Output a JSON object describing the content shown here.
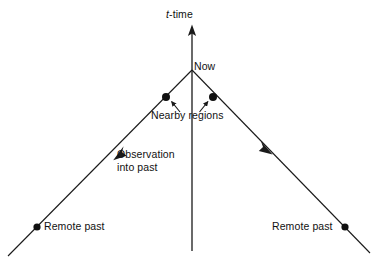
{
  "diagram": {
    "kind": "spacetime-light-cone",
    "background_color": "#ffffff",
    "line_color": "#1a1a1a",
    "text_color": "#111111",
    "axis": {
      "name": "t-time",
      "symbol": "t",
      "symbol_style": "italic",
      "suffix": "-time",
      "direction": "up",
      "arrowhead": true,
      "top_y": 25,
      "bottom_y": 251,
      "x": 192
    },
    "apex": {
      "label": "Now",
      "x": 192,
      "y": 70
    },
    "cone": {
      "left_end": {
        "x": 8,
        "y": 256
      },
      "right_end": {
        "x": 370,
        "y": 253
      }
    },
    "labels": {
      "axis_title": "t-time",
      "now": "Now",
      "nearby_regions": "Nearby regions",
      "observation_line1": "Observation",
      "observation_line2": "into past",
      "remote_past_left": "Remote past",
      "remote_past_right": "Remote past"
    },
    "points": [
      {
        "name": "nearby-region-left",
        "x": 166,
        "y": 97,
        "radius": 4.0,
        "label": "Nearby regions"
      },
      {
        "name": "nearby-region-right",
        "x": 213,
        "y": 97,
        "radius": 4.0,
        "label": "Nearby regions"
      },
      {
        "name": "remote-past-left",
        "x": 37,
        "y": 227,
        "radius": 3.6,
        "label": "Remote past"
      },
      {
        "name": "remote-past-right",
        "x": 345,
        "y": 227,
        "radius": 3.6,
        "label": "Remote past"
      }
    ],
    "arrows": [
      {
        "name": "observation-arrow-left",
        "points_to": "down-left",
        "tip_x": 114,
        "tip_y": 160,
        "label": "Observation into past"
      },
      {
        "name": "observation-arrow-right",
        "points_to": "down-right",
        "tip_x": 272,
        "tip_y": 154,
        "label": ""
      },
      {
        "name": "nearby-pointer-left",
        "points_to": "up-right",
        "tip_x": 171,
        "tip_y": 101,
        "label": "Nearby regions"
      },
      {
        "name": "nearby-pointer-right",
        "points_to": "up-left",
        "tip_x": 208,
        "tip_y": 101,
        "label": "Nearby regions"
      }
    ]
  }
}
